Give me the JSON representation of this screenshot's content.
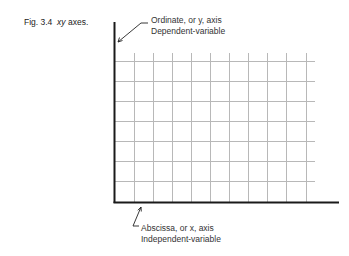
{
  "caption": {
    "figure_number": "Fig. 3.4",
    "title_italic": "xy",
    "title_rest": "axes."
  },
  "ordinate_label": {
    "line1": "Ordinate, or y, axis",
    "line2": "Dependent-variable"
  },
  "abscissa_label": {
    "line1": "Abscissa, or x, axis",
    "line2": "Independent-variable"
  },
  "diagram": {
    "vertical_grid_lines": 10,
    "horizontal_grid_lines": 8,
    "axis_color": "#1a1a1a",
    "grid_color": "#b8b8b8"
  }
}
